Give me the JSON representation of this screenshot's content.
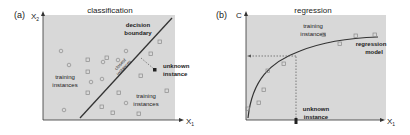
{
  "panel_a": {
    "label": "(a)",
    "title": "classification",
    "y_axis_label": "X",
    "y_axis_sub": "2",
    "x_axis_label": "X",
    "x_axis_sub": "1",
    "boundary_label_line1": "decision",
    "boundary_label_line2": "boundary",
    "closest_line1": "closest",
    "closest_line2": "instances",
    "unknown_line1": "unknown",
    "unknown_line2": "instance",
    "training_left_line1": "training",
    "training_left_line2": "instances",
    "training_right_line1": "training",
    "training_right_line2": "instances"
  },
  "panel_b": {
    "label": "(b)",
    "title": "regression",
    "y_axis_label": "C",
    "x_axis_label": "X",
    "x_axis_sub": "1",
    "training_line1": "training",
    "training_line2": "instances",
    "model_line1": "regression",
    "model_line2": "model",
    "unknown_line1": "unknown",
    "unknown_line2": "instance"
  },
  "colors": {
    "plot_bg": "#d8d8d8",
    "line": "#333333",
    "marker": "#8a8a8a"
  }
}
